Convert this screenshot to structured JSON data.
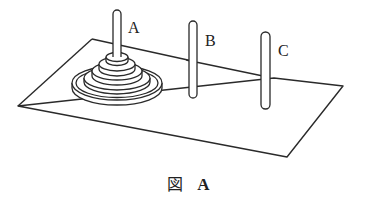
{
  "figure": {
    "caption": {
      "kanji": "図",
      "letter": "A"
    },
    "pegs": [
      {
        "label": "A",
        "disks": 5
      },
      {
        "label": "B",
        "disks": 0
      },
      {
        "label": "C",
        "disks": 0
      }
    ]
  }
}
